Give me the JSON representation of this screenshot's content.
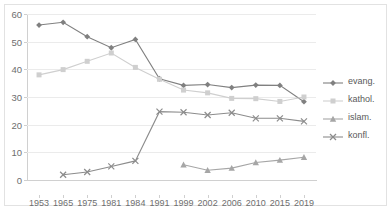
{
  "chart_data": {
    "type": "line",
    "title": "",
    "xlabel": "",
    "ylabel": "",
    "categories": [
      "1953",
      "1965",
      "1975",
      "1981",
      "1984",
      "1991",
      "1999",
      "2002",
      "2006",
      "2010",
      "2015",
      "2019"
    ],
    "ylim": [
      0,
      60
    ],
    "yticks": [
      0,
      10,
      20,
      30,
      40,
      50,
      60
    ],
    "grid": true,
    "legend_position": "right",
    "series": [
      {
        "name": "evang.",
        "marker": "diamond",
        "color": "#808080",
        "values": [
          56.0,
          57.0,
          51.8,
          47.8,
          50.8,
          36.6,
          34.2,
          34.5,
          33.4,
          34.3,
          34.2,
          28.3
        ]
      },
      {
        "name": "kathol.",
        "marker": "square",
        "color": "#cfcfcf",
        "values": [
          38.0,
          39.9,
          42.9,
          45.9,
          40.7,
          36.4,
          32.5,
          31.5,
          29.5,
          29.4,
          28.4,
          30.0
        ]
      },
      {
        "name": "islam.",
        "marker": "triangle",
        "color": "#a6a6a6",
        "values": [
          null,
          null,
          null,
          null,
          null,
          null,
          5.5,
          3.5,
          4.3,
          6.3,
          7.2,
          8.2
        ]
      },
      {
        "name": "konfl.",
        "marker": "cross",
        "color": "#8c8c8c",
        "values": [
          null,
          1.9,
          2.9,
          4.9,
          6.9,
          24.7,
          24.5,
          23.5,
          24.3,
          22.3,
          22.3,
          21.2
        ]
      }
    ]
  },
  "legend": {
    "items": [
      {
        "label": "evang."
      },
      {
        "label": "kathol."
      },
      {
        "label": "islam."
      },
      {
        "label": "konfl."
      }
    ]
  },
  "colors": {
    "evang": "#808080",
    "kathol": "#cfcfcf",
    "islam": "#a6a6a6",
    "konfl": "#8c8c8c",
    "gridline": "#ebebeb",
    "axis": "#d0d0d0",
    "tick_text": "#6e6e6e"
  }
}
